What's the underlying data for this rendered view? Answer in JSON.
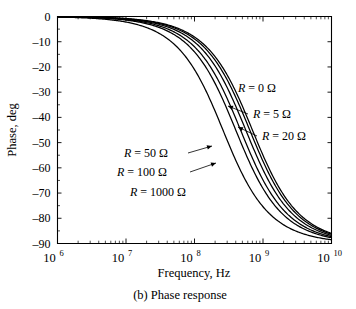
{
  "chart_data": {
    "type": "line",
    "title": "",
    "caption": "(b) Phase response",
    "xlabel": "Frequency, Hz",
    "ylabel": "Phase, deg",
    "xscale": "log",
    "xlim": [
      1000000,
      10000000000
    ],
    "ylim": [
      -90,
      0
    ],
    "grid": false,
    "legend_position": "inline-annotations",
    "xticks": [
      {
        "value": 1000000,
        "mantissa": "10",
        "exponent": "6",
        "label": "10^6"
      },
      {
        "value": 10000000,
        "mantissa": "10",
        "exponent": "7",
        "label": "10^7"
      },
      {
        "value": 100000000,
        "mantissa": "10",
        "exponent": "8",
        "label": "10^8"
      },
      {
        "value": 1000000000,
        "mantissa": "10",
        "exponent": "9",
        "label": "10^9"
      },
      {
        "value": 10000000000,
        "mantissa": "10",
        "exponent": "10",
        "label": "10^10"
      }
    ],
    "yticks": [
      {
        "value": 0,
        "label": "0"
      },
      {
        "value": -10,
        "label": "–10"
      },
      {
        "value": -20,
        "label": "–20"
      },
      {
        "value": -30,
        "label": "–30"
      },
      {
        "value": -40,
        "label": "–40"
      },
      {
        "value": -50,
        "label": "–50"
      },
      {
        "value": -60,
        "label": "–60"
      },
      {
        "value": -70,
        "label": "–70"
      },
      {
        "value": -80,
        "label": "–80"
      },
      {
        "value": -90,
        "label": "–90"
      }
    ],
    "series": [
      {
        "name": "R = 0 Ω",
        "resistance_ohm": 0,
        "corner_frequency_hz": 700000000,
        "label": "R = 0 Ω",
        "label_x": 238,
        "label_y": 92,
        "leader": false,
        "x": [
          1000000,
          2000000,
          5000000,
          10000000,
          20000000,
          50000000,
          100000000,
          150000000,
          200000000,
          300000000,
          400000000,
          500000000,
          700000000,
          1000000000,
          1500000000,
          2000000000,
          3000000000,
          5000000000,
          7000000000,
          10000000000
        ],
        "y": [
          -0.08,
          -0.16,
          -0.41,
          -0.82,
          -1.64,
          -4.08,
          -8.13,
          -12.09,
          -15.95,
          -23.2,
          -29.7,
          -35.5,
          -45.0,
          -55.0,
          -65.0,
          -70.7,
          -76.8,
          -82.2,
          -84.4,
          -86.0
        ]
      },
      {
        "name": "R = 5 Ω",
        "resistance_ohm": 5,
        "corner_frequency_hz": 640000000,
        "label": "R = 5 Ω",
        "label_x": 253,
        "label_y": 118,
        "leader": true,
        "leader_from_x": 248,
        "leader_from_y": 114,
        "leader_to_x": 228,
        "leader_to_y": 106,
        "x": [
          1000000,
          2000000,
          5000000,
          10000000,
          20000000,
          50000000,
          100000000,
          150000000,
          200000000,
          300000000,
          400000000,
          500000000,
          700000000,
          1000000000,
          1500000000,
          2000000000,
          3000000000,
          5000000000,
          7000000000,
          10000000000
        ],
        "y": [
          -0.09,
          -0.18,
          -0.45,
          -0.9,
          -1.79,
          -4.46,
          -8.88,
          -13.18,
          -17.35,
          -25.1,
          -32.0,
          -38.1,
          -47.8,
          -57.6,
          -67.2,
          -72.6,
          -78.3,
          -83.2,
          -85.2,
          -86.6
        ]
      },
      {
        "name": "R = 20 Ω",
        "resistance_ohm": 20,
        "corner_frequency_hz": 560000000,
        "label": "R = 20 Ω",
        "label_x": 262,
        "label_y": 140,
        "leader": true,
        "leader_from_x": 257,
        "leader_from_y": 136,
        "leader_to_x": 238,
        "leader_to_y": 127,
        "x": [
          1000000,
          2000000,
          5000000,
          10000000,
          20000000,
          50000000,
          100000000,
          150000000,
          200000000,
          300000000,
          400000000,
          500000000,
          700000000,
          1000000000,
          1500000000,
          2000000000,
          3000000000,
          5000000000,
          7000000000,
          10000000000
        ],
        "y": [
          -0.1,
          -0.2,
          -0.51,
          -1.02,
          -2.05,
          -5.1,
          -10.1,
          -14.96,
          -19.65,
          -28.2,
          -35.6,
          -41.8,
          -51.4,
          -60.7,
          -69.5,
          -74.4,
          -79.6,
          -84.0,
          -85.9,
          -87.1
        ]
      },
      {
        "name": "R = 50 Ω",
        "resistance_ohm": 50,
        "corner_frequency_hz": 470000000,
        "label": "R = 50 Ω",
        "label_x": 124,
        "label_y": 157,
        "leader": true,
        "leader_from_x": 188,
        "leader_from_y": 153,
        "leader_to_x": 212,
        "leader_to_y": 146,
        "x": [
          1000000,
          2000000,
          5000000,
          10000000,
          20000000,
          50000000,
          100000000,
          150000000,
          200000000,
          300000000,
          400000000,
          500000000,
          700000000,
          1000000000,
          1500000000,
          2000000000,
          3000000000,
          5000000000,
          7000000000,
          10000000000
        ],
        "y": [
          -0.12,
          -0.24,
          -0.61,
          -1.22,
          -2.44,
          -6.07,
          -11.98,
          -17.66,
          -23.06,
          -32.6,
          -40.4,
          -46.8,
          -56.2,
          -64.8,
          -72.6,
          -76.8,
          -81.3,
          -85.0,
          -86.6,
          -87.7
        ]
      },
      {
        "name": "R = 100 Ω",
        "resistance_ohm": 100,
        "corner_frequency_hz": 400000000,
        "label": "R = 100 Ω",
        "label_x": 117,
        "label_y": 176,
        "leader": true,
        "leader_from_x": 190,
        "leader_from_y": 172,
        "leader_to_x": 216,
        "leader_to_y": 163,
        "x": [
          1000000,
          2000000,
          5000000,
          10000000,
          20000000,
          50000000,
          100000000,
          150000000,
          200000000,
          300000000,
          400000000,
          500000000,
          700000000,
          1000000000,
          1500000000,
          2000000000,
          3000000000,
          5000000000,
          7000000000,
          10000000000
        ],
        "y": [
          -0.14,
          -0.29,
          -0.72,
          -1.43,
          -2.86,
          -7.13,
          -14.04,
          -20.56,
          -26.57,
          -36.9,
          -45.0,
          -51.3,
          -60.3,
          -68.2,
          -75.1,
          -78.7,
          -82.6,
          -85.8,
          -87.1,
          -88.1
        ]
      },
      {
        "name": "R = 1000 Ω",
        "resistance_ohm": 1000,
        "corner_frequency_hz": 260000000,
        "label": "R = 1000 Ω",
        "label_x": 130,
        "label_y": 196,
        "leader": false,
        "x": [
          1000000,
          2000000,
          5000000,
          10000000,
          20000000,
          50000000,
          100000000,
          150000000,
          200000000,
          300000000,
          400000000,
          500000000,
          700000000,
          1000000000,
          1500000000,
          2000000000,
          3000000000,
          5000000000,
          7000000000,
          10000000000
        ],
        "y": [
          -0.22,
          -0.44,
          -1.1,
          -2.2,
          -4.4,
          -10.9,
          -21.0,
          -30.0,
          -37.6,
          -49.1,
          -57.2,
          -62.6,
          -69.9,
          -75.5,
          -80.3,
          -82.7,
          -85.1,
          -87.1,
          -87.9,
          -88.5
        ]
      }
    ]
  },
  "axes": {
    "ylabel": "Phase, deg",
    "xlabel": "Frequency, Hz"
  },
  "caption": {
    "text": "(b) Phase response"
  }
}
